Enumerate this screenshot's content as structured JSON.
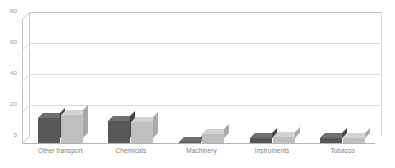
{
  "chart_data": {
    "type": "bar",
    "title": "",
    "subtitle": "",
    "xlabel": "",
    "ylabel": "",
    "ylim": [
      0,
      80
    ],
    "yticks": [
      0,
      20,
      40,
      60,
      80
    ],
    "grid": true,
    "legend": "none",
    "style": "3d-grouped-bars",
    "categories": [
      "Other transport",
      "Chemicals",
      "Machinery",
      "Instruments",
      "Tobacco"
    ],
    "series": [
      {
        "name": "Series 1",
        "color": "#58585a",
        "top_color": "#6f6f71",
        "side_color": "#46464a",
        "values": [
          16,
          14,
          0.5,
          3,
          3
        ]
      },
      {
        "name": "Series 2",
        "color": "#bfbfbf",
        "top_color": "#d2d2d2",
        "side_color": "#a9a9a9",
        "values": [
          18,
          13.5,
          6,
          4,
          3.5
        ]
      }
    ]
  },
  "colors": {
    "background": "#ffffff",
    "gridline": "#dddddd",
    "axis_line": "#c8c8c8",
    "baseline": "#b4b4b4",
    "tick_label": "#9b9b9b",
    "category_label": "#7d7d7d"
  }
}
